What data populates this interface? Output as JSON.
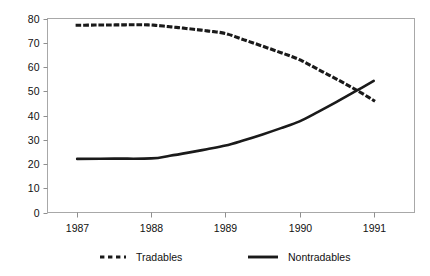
{
  "chart_data": {
    "type": "line",
    "title": "",
    "subtitle": "",
    "xlabel": "",
    "ylabel": "",
    "x": [
      1987,
      1988,
      1989,
      1990,
      1991
    ],
    "xlim": [
      1986.6,
      1991.55
    ],
    "ylim": [
      0,
      80
    ],
    "ytick_labels": [
      "0",
      "10",
      "20",
      "30",
      "40",
      "50",
      "60",
      "70",
      "80"
    ],
    "ytick_values": [
      0,
      10,
      20,
      30,
      40,
      50,
      60,
      70,
      80
    ],
    "xtick_labels": [
      "1987",
      "1988",
      "1989",
      "1990",
      "1991"
    ],
    "xtick_values": [
      1987,
      1988,
      1989,
      1990,
      1991
    ],
    "grid": false,
    "legend_position": "bottom",
    "series": [
      {
        "name": "Tradables",
        "style": "dotted",
        "color": "#1a1a1a",
        "values": [
          77.2,
          77.3,
          73.8,
          63.0,
          46.2
        ],
        "dense_x": [
          1987.0,
          1987.25,
          1987.5,
          1987.75,
          1988.0,
          1988.25,
          1988.5,
          1988.75,
          1989.0,
          1989.25,
          1989.5,
          1989.75,
          1990.0,
          1990.25,
          1990.5,
          1990.75,
          1991.0
        ],
        "dense_y": [
          77.2,
          77.3,
          77.35,
          77.4,
          77.3,
          76.6,
          75.8,
          74.9,
          73.8,
          71.2,
          68.6,
          65.9,
          63.0,
          59.0,
          55.0,
          50.8,
          46.2
        ]
      },
      {
        "name": "Nontradables",
        "style": "solid",
        "color": "#1a1a1a",
        "values": [
          22.1,
          22.3,
          27.6,
          37.6,
          54.3
        ],
        "dense_x": [
          1987.0,
          1987.5,
          1988.0,
          1988.25,
          1988.5,
          1988.75,
          1989.0,
          1989.25,
          1989.5,
          1989.75,
          1990.0,
          1990.25,
          1990.5,
          1990.75,
          1991.0
        ],
        "dense_y": [
          22.1,
          22.2,
          22.3,
          23.4,
          24.7,
          26.1,
          27.6,
          29.8,
          32.2,
          34.8,
          37.6,
          41.5,
          45.6,
          49.9,
          54.3
        ]
      }
    ],
    "annotations": [],
    "colors": {
      "axis": "#8f8f8f",
      "plot_border": "#a8a8a8",
      "series_line": "#1a1a1a",
      "background": "#ffffff",
      "text": "#111111"
    }
  },
  "legend": {
    "items": [
      {
        "label": "Tradables",
        "style": "dotted"
      },
      {
        "label": "Nontradables",
        "style": "solid"
      }
    ]
  },
  "axes": {
    "y": {
      "labels": [
        "80",
        "70",
        "60",
        "50",
        "40",
        "30",
        "20",
        "10",
        "0"
      ]
    },
    "x": {
      "labels": [
        "1987",
        "1988",
        "1989",
        "1990",
        "1991"
      ]
    }
  }
}
